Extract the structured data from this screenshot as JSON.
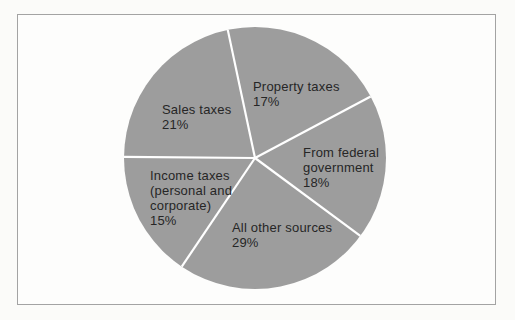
{
  "figure": {
    "kind": "scanned textbook pie chart figure",
    "background": "#fbfbf9",
    "frame_border_color": "#a3a3a3"
  },
  "chart_data": {
    "type": "pie",
    "title": "",
    "labels": [
      "Property taxes",
      "From federal government",
      "All other sources",
      "Income taxes (personal and corporate)",
      "Sales taxes"
    ],
    "values": [
      17,
      18,
      29,
      15,
      21
    ],
    "unit": "%",
    "legend_position": "none",
    "slices": [
      {
        "id": "property-taxes",
        "label": "Property taxes",
        "value": 17,
        "pct_label": "17%",
        "label_lines": [
          "Property taxes",
          "17%"
        ],
        "label_pos": [
          253,
          79
        ]
      },
      {
        "id": "from-federal-government",
        "label": "From federal government",
        "value": 18,
        "pct_label": "18%",
        "label_lines": [
          "From federal",
          "government",
          "18%"
        ],
        "label_pos": [
          303,
          145
        ]
      },
      {
        "id": "all-other-sources",
        "label": "All other sources",
        "value": 29,
        "pct_label": "29%",
        "label_lines": [
          "All other sources",
          "29%"
        ],
        "label_pos": [
          232,
          220
        ]
      },
      {
        "id": "income-taxes",
        "label": "Income taxes (personal and corporate)",
        "value": 15,
        "pct_label": "15%",
        "label_lines": [
          "Income taxes",
          "(personal and",
          "corporate)",
          "15%"
        ],
        "label_pos": [
          150,
          168
        ]
      },
      {
        "id": "sales-taxes",
        "label": "Sales taxes",
        "value": 21,
        "pct_label": "21%",
        "label_lines": [
          "Sales taxes",
          "21%"
        ],
        "label_pos": [
          162,
          102
        ]
      }
    ],
    "style": {
      "slice_fill": "#9d9d9d",
      "divider_color": "#ffffff",
      "divider_width": 2.2,
      "label_text_color": "#262626"
    },
    "layout": {
      "center": [
        255,
        158
      ],
      "radius": 131,
      "direction": "clockwise",
      "angles_from_12_oclock": true,
      "boundary_angles_deg": [
        348,
        62,
        126.5,
        214,
        270.5
      ]
    }
  }
}
